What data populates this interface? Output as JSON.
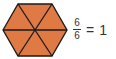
{
  "diagram": {
    "shape": "hexagon",
    "divisions": 6,
    "shaded": 6,
    "fill_color": "#E07A45",
    "stroke_color": "#1a1a1a"
  },
  "equation": {
    "numerator": "6",
    "denominator": "6",
    "equals": "=",
    "result": "1"
  }
}
